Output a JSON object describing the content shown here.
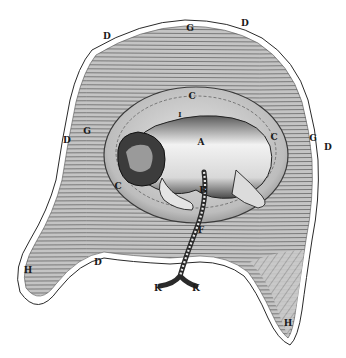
{
  "figure": {
    "colors": {
      "background": "#ffffff",
      "ink": "#1a1a1a",
      "uterus_fill": "#b8b8b8",
      "uterus_hatch": "#7a7a7a",
      "amnion_fill": "#cfcfcf",
      "fetus_light": "#eeeeee",
      "fetus_shadow": "#3a3a3a"
    },
    "labels": [
      {
        "id": "d-top-left",
        "text": "D",
        "x": 107,
        "y": 36
      },
      {
        "id": "g-top",
        "text": "G",
        "x": 190,
        "y": 28
      },
      {
        "id": "d-top-right",
        "text": "D",
        "x": 245,
        "y": 23
      },
      {
        "id": "d-left",
        "text": "D",
        "x": 67,
        "y": 140
      },
      {
        "id": "g-left",
        "text": "G",
        "x": 87,
        "y": 131
      },
      {
        "id": "c-top",
        "text": "C",
        "x": 192,
        "y": 96
      },
      {
        "id": "i-small",
        "text": "I",
        "x": 180,
        "y": 114
      },
      {
        "id": "a-fetus",
        "text": "A",
        "x": 201,
        "y": 142
      },
      {
        "id": "c-right",
        "text": "C",
        "x": 274,
        "y": 137
      },
      {
        "id": "g-right",
        "text": "G",
        "x": 313,
        "y": 138
      },
      {
        "id": "d-right",
        "text": "D",
        "x": 328,
        "y": 147
      },
      {
        "id": "c-left",
        "text": "C",
        "x": 118,
        "y": 186
      },
      {
        "id": "b-cord",
        "text": "B",
        "x": 203,
        "y": 190
      },
      {
        "id": "f-cord",
        "text": "F",
        "x": 201,
        "y": 230
      },
      {
        "id": "h-left",
        "text": "H",
        "x": 28,
        "y": 270
      },
      {
        "id": "d-bottom",
        "text": "D",
        "x": 98,
        "y": 262
      },
      {
        "id": "k-left",
        "text": "K",
        "x": 158,
        "y": 288
      },
      {
        "id": "k-right",
        "text": "K",
        "x": 196,
        "y": 288
      },
      {
        "id": "h-right",
        "text": "H",
        "x": 288,
        "y": 323
      }
    ]
  }
}
